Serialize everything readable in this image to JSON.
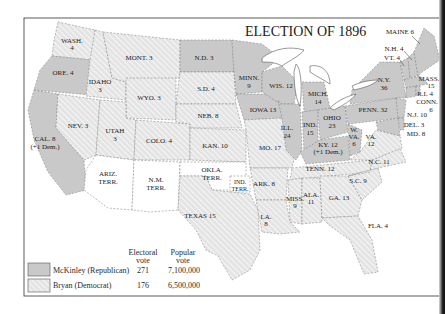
{
  "title": "ELECTION OF 1896",
  "colors": {
    "republican_fill": "#c9c9c9",
    "democrat_hatch_bg": "#e4e4e4",
    "democrat_hatch_line": "#ffffff",
    "territory_fill": "#ffffff",
    "border": "#333333"
  },
  "legend": {
    "col_electoral": "Electoral",
    "col_electoral_2": "vote",
    "col_popular": "Popular",
    "col_popular_2": "vote",
    "rows": [
      {
        "party": "McKinley (Republican)",
        "electoral": "271",
        "popular": "7,100,000",
        "pattern": "solid-gray"
      },
      {
        "party": "Bryan (Democrat)",
        "electoral": "176",
        "popular": "6,500,000",
        "pattern": "hatched"
      }
    ]
  },
  "states": {
    "wash": {
      "l1": "WASH.",
      "l2": "4",
      "winner": "Bryan"
    },
    "ore": {
      "l1": "ORE. 4",
      "winner": "McKinley"
    },
    "cal": {
      "l1": "CAL. 8",
      "l2": "(+1 Dem.)",
      "winner": "McKinley"
    },
    "idaho": {
      "l1": "IDAHO",
      "l2": "3",
      "winner": "Bryan"
    },
    "nev": {
      "l1": "NEV. 3",
      "winner": "Bryan"
    },
    "mont": {
      "l1": "MONT. 3",
      "winner": "Bryan"
    },
    "wyo": {
      "l1": "WYO. 3",
      "winner": "Bryan"
    },
    "utah": {
      "l1": "UTAH",
      "l2": "3",
      "winner": "Bryan"
    },
    "colo": {
      "l1": "COLO. 4",
      "winner": "Bryan"
    },
    "ariz": {
      "l1": "ARIZ.",
      "l2": "TERR.",
      "winner": "Territory"
    },
    "nm": {
      "l1": "N.M.",
      "l2": "TERR.",
      "winner": "Territory"
    },
    "nd": {
      "l1": "N.D. 3",
      "winner": "McKinley"
    },
    "sd": {
      "l1": "S.D. 4",
      "winner": "Bryan"
    },
    "neb": {
      "l1": "NEB. 8",
      "winner": "Bryan"
    },
    "kan": {
      "l1": "KAN. 10",
      "winner": "Bryan"
    },
    "okla": {
      "l1": "OKLA.",
      "l2": "TERR.",
      "winner": "Territory"
    },
    "ind_terr": {
      "l1": "IND.",
      "l2": "TERR.",
      "winner": "Territory"
    },
    "texas": {
      "l1": "TEXAS 15",
      "winner": "Bryan"
    },
    "minn": {
      "l1": "MINN.",
      "l2": "9",
      "winner": "McKinley"
    },
    "iowa": {
      "l1": "IOWA 13",
      "winner": "McKinley"
    },
    "mo": {
      "l1": "MO. 17",
      "winner": "Bryan"
    },
    "ark": {
      "l1": "ARK. 8",
      "winner": "Bryan"
    },
    "la": {
      "l1": "LA.",
      "l2": "8",
      "winner": "Bryan"
    },
    "wis": {
      "l1": "WIS. 12",
      "winner": "McKinley"
    },
    "ill": {
      "l1": "ILL.",
      "l2": "24",
      "winner": "McKinley"
    },
    "mich": {
      "l1": "MICH.",
      "l2": "14",
      "winner": "McKinley"
    },
    "ind": {
      "l1": "IND.",
      "l2": "15",
      "winner": "McKinley"
    },
    "ohio": {
      "l1": "OHIO",
      "l2": "23",
      "winner": "McKinley"
    },
    "ky": {
      "l1": "KY. 12",
      "l2": "(+1 Dem.)",
      "winner": "McKinley"
    },
    "tenn": {
      "l1": "TENN. 12",
      "winner": "Bryan"
    },
    "miss": {
      "l1": "MISS.",
      "l2": "9",
      "winner": "Bryan"
    },
    "ala": {
      "l1": "ALA.",
      "l2": "11",
      "winner": "Bryan"
    },
    "ga": {
      "l1": "GA. 13",
      "winner": "Bryan"
    },
    "fla": {
      "l1": "FLA. 4",
      "winner": "Bryan"
    },
    "sc": {
      "l1": "S.C. 9",
      "winner": "Bryan"
    },
    "nc": {
      "l1": "N.C. 11",
      "winner": "Bryan"
    },
    "va": {
      "l1": "VA.",
      "l2": "12",
      "winner": "Bryan"
    },
    "wva": {
      "l1": "W.",
      "l2": "VA.",
      "l3": "6",
      "winner": "McKinley"
    },
    "penn": {
      "l1": "PENN. 32",
      "winner": "McKinley"
    },
    "ny": {
      "l1": "N.Y.",
      "l2": "36",
      "winner": "McKinley"
    },
    "nj": {
      "l1": "N.J. 10",
      "winner": "McKinley"
    },
    "del": {
      "l1": "DEL. 3",
      "winner": "McKinley"
    },
    "md": {
      "l1": "MD. 8",
      "winner": "McKinley"
    },
    "conn": {
      "l1": "CONN.",
      "l2": "6",
      "winner": "McKinley"
    },
    "ri": {
      "l1": "R.I. 4",
      "winner": "McKinley"
    },
    "mass": {
      "l1": "MASS.",
      "l2": "15",
      "winner": "McKinley"
    },
    "vt": {
      "l1": "VT. 4",
      "winner": "McKinley"
    },
    "nh": {
      "l1": "N.H. 4",
      "winner": "McKinley"
    },
    "maine": {
      "l1": "MAINE 6",
      "winner": "McKinley"
    }
  }
}
